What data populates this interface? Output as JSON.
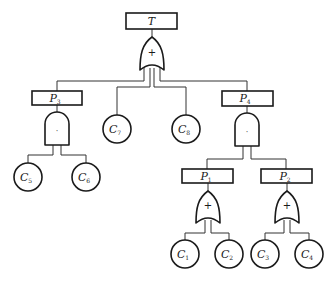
{
  "diagram": {
    "type": "fault-tree",
    "top_event": {
      "label": "T"
    },
    "intermediate_events": [
      {
        "id": "P3",
        "label": "P",
        "sub": "3"
      },
      {
        "id": "P4",
        "label": "P",
        "sub": "4"
      },
      {
        "id": "P1",
        "label": "P",
        "sub": "1"
      },
      {
        "id": "P2",
        "label": "P",
        "sub": "2"
      }
    ],
    "basic_events": [
      {
        "id": "C5",
        "label": "C",
        "sub": "5"
      },
      {
        "id": "C6",
        "label": "C",
        "sub": "6"
      },
      {
        "id": "C7",
        "label": "C",
        "sub": "7"
      },
      {
        "id": "C8",
        "label": "C",
        "sub": "8"
      },
      {
        "id": "C1",
        "label": "C",
        "sub": "1"
      },
      {
        "id": "C2",
        "label": "C",
        "sub": "2"
      },
      {
        "id": "C3",
        "label": "C",
        "sub": "3"
      },
      {
        "id": "C4",
        "label": "C",
        "sub": "4"
      }
    ],
    "gates": {
      "or_symbol": "+",
      "and_symbol": "·"
    },
    "structure": [
      {
        "parent": "T",
        "gate": "OR",
        "children": [
          "P3",
          "C7",
          "C8",
          "P4"
        ]
      },
      {
        "parent": "P3",
        "gate": "AND",
        "children": [
          "C5",
          "C6"
        ]
      },
      {
        "parent": "P4",
        "gate": "AND",
        "children": [
          "P1",
          "P2"
        ]
      },
      {
        "parent": "P1",
        "gate": "OR",
        "children": [
          "C1",
          "C2"
        ]
      },
      {
        "parent": "P2",
        "gate": "OR",
        "children": [
          "C3",
          "C4"
        ]
      }
    ]
  }
}
